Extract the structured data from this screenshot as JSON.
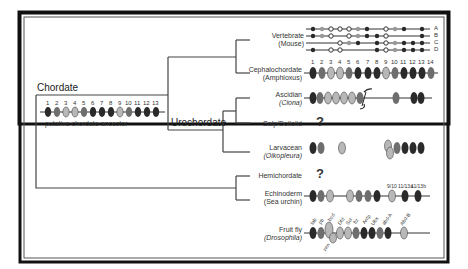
{
  "tree": {
    "root_label": "Chordate",
    "urochordate_label": "Urochordate",
    "ancestor_caption": "putative chordate ancestor",
    "ancestor_genes": [
      "1",
      "2",
      "3",
      "4",
      "5",
      "6",
      "7",
      "8",
      "9",
      "10",
      "11",
      "12",
      "13"
    ]
  },
  "taxa": [
    {
      "id": "vertebrate",
      "name": "Vertebrate",
      "sub": "(Mouse)",
      "clusters": [
        "A",
        "B",
        "C",
        "D"
      ]
    },
    {
      "id": "cephalochordate",
      "name": "Cephalochordate",
      "sub": "(Amphioxus)",
      "genes": [
        "1",
        "2",
        "3",
        "4",
        "5",
        "6",
        "7",
        "8",
        "9",
        "10",
        "11",
        "12",
        "13",
        "14"
      ]
    },
    {
      "id": "ascidian",
      "name": "Ascidian",
      "sub": "(Ciona)"
    },
    {
      "id": "salp",
      "name": "Salp/Doliolid",
      "unknown": "?"
    },
    {
      "id": "larvacean",
      "name": "Larvacean",
      "sub": "(Oikopleura)"
    },
    {
      "id": "hemichordate",
      "name": "Hemichordate",
      "unknown": "?"
    },
    {
      "id": "echinoderm",
      "name": "Echinoderm",
      "sub": "(Sea urchin)",
      "gene_labels": [
        "9/10",
        "11/13a",
        "11/13b"
      ]
    },
    {
      "id": "fruitfly",
      "name": "Fruit fly",
      "sub": "(Drosophila)",
      "gene_labels": [
        "lab",
        "pb",
        "zen",
        "bcd",
        "Dfd",
        "Scr",
        "ftz",
        "Antp",
        "Ubx",
        "abd-A",
        "Abd-B"
      ]
    }
  ],
  "colors": {
    "dark": "#2a2a2a",
    "mid": "#6e6e6e",
    "light": "#b8b8b8",
    "line": "#444444"
  }
}
